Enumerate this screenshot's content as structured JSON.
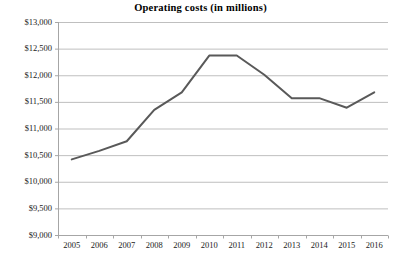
{
  "chart_data": {
    "type": "line",
    "title": "Operating costs (in millions)",
    "xlabel": "",
    "ylabel": "",
    "categories": [
      "2005",
      "2006",
      "2007",
      "2008",
      "2009",
      "2010",
      "2011",
      "2012",
      "2013",
      "2014",
      "2015",
      "2016"
    ],
    "values": [
      10420,
      10580,
      10760,
      11350,
      11680,
      12370,
      12370,
      12010,
      11570,
      11570,
      11390,
      11680
    ],
    "series": [
      {
        "name": "Operating costs",
        "values": [
          10420,
          10580,
          10760,
          11350,
          11680,
          12370,
          12370,
          12010,
          11570,
          11570,
          11390,
          11680
        ]
      }
    ],
    "ylim": [
      9000,
      13000
    ],
    "ytick_values": [
      9000,
      9500,
      10000,
      10500,
      11000,
      11500,
      12000,
      12500,
      13000
    ],
    "ytick_labels": [
      "$9,000",
      "$9,500",
      "$10,000",
      "$10,500",
      "$11,000",
      "$11,500",
      "$12,000",
      "$12,500",
      "$13,000"
    ],
    "grid": true,
    "grid_axis": "y",
    "legend": false,
    "legend_position": "none",
    "markers": false,
    "line_color": "#595959",
    "line_width": 2,
    "grid_color": "#bfbfbf",
    "axis_color": "#a6a6a6",
    "background_color": "#ffffff",
    "text_color": "#1a1a1a"
  }
}
